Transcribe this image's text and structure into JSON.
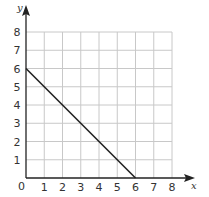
{
  "chart_data": {
    "type": "line",
    "title": "",
    "xlabel": "x",
    "ylabel": "y",
    "xlim": [
      0,
      8
    ],
    "ylim": [
      0,
      8
    ],
    "grid": true,
    "x_ticks": [
      "1",
      "2",
      "3",
      "4",
      "5",
      "6",
      "7",
      "8"
    ],
    "y_ticks": [
      "1",
      "2",
      "3",
      "4",
      "5",
      "6",
      "7",
      "8"
    ],
    "origin_label": "0",
    "series": [
      {
        "name": "line",
        "x": [
          0,
          6
        ],
        "y": [
          6,
          0
        ],
        "color": "#222222"
      }
    ]
  },
  "colors": {
    "grid": "#c8c8c8",
    "axis": "#222222",
    "line": "#222222"
  }
}
